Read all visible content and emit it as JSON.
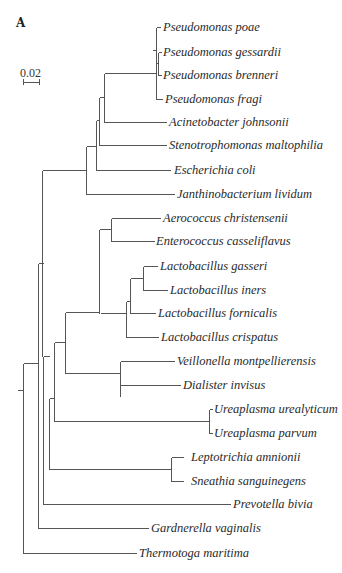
{
  "figure": {
    "panel_label": "A",
    "scale_bar": {
      "label": "0.02",
      "x1": 23,
      "x2": 39,
      "y": 82
    }
  },
  "tree": {
    "line_color": "#555555",
    "branches": [
      [
        156,
        27,
        156,
        99
      ],
      [
        156,
        27,
        160,
        27
      ],
      [
        156,
        99,
        162,
        99
      ],
      [
        152,
        50,
        156,
        50
      ],
      [
        156,
        50,
        156,
        50
      ],
      [
        158,
        52,
        158,
        75
      ],
      [
        158,
        52,
        161,
        52
      ],
      [
        158,
        75,
        161,
        75
      ],
      [
        156,
        63,
        158,
        63
      ],
      [
        104,
        73,
        156,
        73
      ],
      [
        104,
        73,
        104,
        122
      ],
      [
        104,
        122,
        166,
        122
      ],
      [
        99,
        97,
        104,
        97
      ],
      [
        99,
        97,
        99,
        145
      ],
      [
        99,
        145,
        166,
        145
      ],
      [
        96,
        120,
        99,
        120
      ],
      [
        96,
        120,
        96,
        170
      ],
      [
        96,
        170,
        170,
        170
      ],
      [
        86,
        146,
        96,
        146
      ],
      [
        86,
        146,
        86,
        194
      ],
      [
        86,
        194,
        174,
        194
      ],
      [
        42,
        170,
        86,
        170
      ],
      [
        42,
        170,
        42,
        356
      ],
      [
        111,
        218,
        160,
        218
      ],
      [
        111,
        218,
        111,
        241
      ],
      [
        111,
        241,
        154,
        241
      ],
      [
        99,
        229,
        111,
        229
      ],
      [
        99,
        229,
        99,
        313
      ],
      [
        143,
        266,
        157,
        266
      ],
      [
        143,
        266,
        143,
        290
      ],
      [
        143,
        290,
        167,
        290
      ],
      [
        130,
        278,
        143,
        278
      ],
      [
        130,
        278,
        130,
        313
      ],
      [
        130,
        313,
        155,
        313
      ],
      [
        126,
        301,
        130,
        301
      ],
      [
        126,
        301,
        126,
        337
      ],
      [
        126,
        337,
        158,
        337
      ],
      [
        100,
        313,
        126,
        313
      ],
      [
        65,
        312,
        99,
        312
      ],
      [
        65,
        312,
        65,
        373
      ],
      [
        120,
        373,
        120,
        396
      ],
      [
        120,
        361,
        174,
        361
      ],
      [
        120,
        385,
        180,
        385
      ],
      [
        120,
        361,
        120,
        385
      ],
      [
        65,
        373,
        120,
        373
      ],
      [
        54,
        342,
        65,
        342
      ],
      [
        54,
        342,
        54,
        421
      ],
      [
        209,
        409,
        212,
        409
      ],
      [
        209,
        409,
        209,
        433
      ],
      [
        209,
        433,
        212,
        433
      ],
      [
        54,
        421,
        209,
        421
      ],
      [
        49,
        398,
        54,
        398
      ],
      [
        49,
        398,
        49,
        469
      ],
      [
        171,
        457,
        183,
        457
      ],
      [
        171,
        457,
        171,
        481
      ],
      [
        171,
        481,
        183,
        481
      ],
      [
        49,
        469,
        171,
        469
      ],
      [
        43,
        356,
        49,
        356
      ],
      [
        43,
        356,
        43,
        504
      ],
      [
        43,
        504,
        230,
        504
      ],
      [
        38,
        263,
        43,
        263
      ],
      [
        38,
        263,
        38,
        528
      ],
      [
        38,
        528,
        148,
        528
      ],
      [
        23,
        363,
        38,
        363
      ],
      [
        23,
        363,
        23,
        553
      ],
      [
        23,
        553,
        136,
        553
      ],
      [
        17,
        390,
        23,
        390
      ]
    ],
    "leaves": [
      {
        "name": "Pseudomonas poae",
        "x": 163,
        "y": 31
      },
      {
        "name": "Pseudomonas gessardii",
        "x": 163,
        "y": 56
      },
      {
        "name": "Pseudomonas brenneri",
        "x": 163,
        "y": 79
      },
      {
        "name": "Pseudomonas fragi",
        "x": 165,
        "y": 103
      },
      {
        "name": "Acinetobacter johnsonii",
        "x": 169,
        "y": 126
      },
      {
        "name": "Stenotrophomonas maltophilia",
        "x": 169,
        "y": 149
      },
      {
        "name": "Escherichia coli",
        "x": 174,
        "y": 174
      },
      {
        "name": "Janthinobacterium lividum",
        "x": 177,
        "y": 198
      },
      {
        "name": "Aerococcus christensenii",
        "x": 163,
        "y": 222
      },
      {
        "name": "Enterococcus casseliflavus",
        "x": 156,
        "y": 245
      },
      {
        "name": "Lactobacillus gasseri",
        "x": 160,
        "y": 270
      },
      {
        "name": "Lactobacillus iners",
        "x": 170,
        "y": 294
      },
      {
        "name": "Lactobacillus fornicalis",
        "x": 158,
        "y": 317
      },
      {
        "name": "Lactobacillus crispatus",
        "x": 161,
        "y": 341
      },
      {
        "name": "Veillonella montpellierensis",
        "x": 177,
        "y": 365
      },
      {
        "name": "Dialister invisus",
        "x": 183,
        "y": 389
      },
      {
        "name": "Ureaplasma urealyticum",
        "x": 214,
        "y": 413
      },
      {
        "name": "Ureaplasma parvum",
        "x": 214,
        "y": 437
      },
      {
        "name": "Leptotrichia amnionii",
        "x": 191,
        "y": 461
      },
      {
        "name": "Sneathia sanguinegens",
        "x": 191,
        "y": 485
      },
      {
        "name": "Prevotella bivia",
        "x": 233,
        "y": 508
      },
      {
        "name": "Gardnerella vaginalis",
        "x": 151,
        "y": 532
      },
      {
        "name": "Thermotoga maritima",
        "x": 139,
        "y": 557
      }
    ]
  }
}
